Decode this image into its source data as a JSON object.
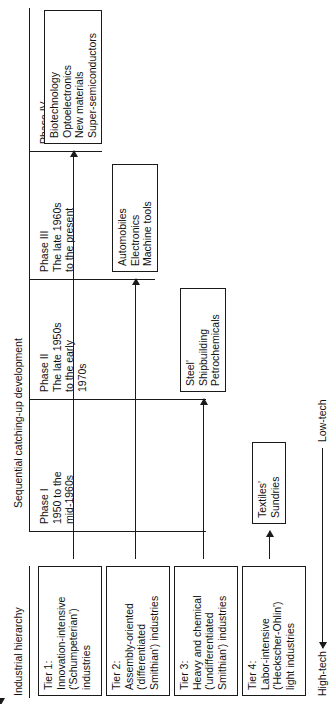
{
  "figure": {
    "left_header": "Industrial hierarchy",
    "right_header": "Sequential catching-up development",
    "axis_top_label": "High-tech",
    "axis_bottom_label": "Low-tech"
  },
  "phases": [
    {
      "name": "Phase I",
      "period": "1950 to the\nmid-1960s"
    },
    {
      "name": "Phase II",
      "period": "The late 1950s\nto the early\n1970s"
    },
    {
      "name": "Phase III",
      "period": "The late 1960s\nto the present"
    },
    {
      "name": "Phase IV",
      "period": "The early 1980s\nonward"
    }
  ],
  "tiers": [
    {
      "id": "tier-1",
      "label": "Tier 1:\nInnovation-intensive\n('Schumpeterian')\nindustries"
    },
    {
      "id": "tier-2",
      "label": "Tier 2:\nAssembly-oriented\n('differentiated\nSmithian') industries"
    },
    {
      "id": "tier-3",
      "label": "Tier 3:\nHeavy and chemical\n('undifferentiated\nSmithian') industries"
    },
    {
      "id": "tier-4",
      "label": "Tier 4:\nLabor-intensive\n('Heckscher-Ohlin')\nlight industries"
    }
  ],
  "industry_boxes": [
    {
      "id": "tier-1-industries",
      "tier": "Tier 1",
      "phase": "Phase IV",
      "items": "Biotechnology\nOptoelectronics\nNew materials\nSuper-semiconductors"
    },
    {
      "id": "tier-2-industries",
      "tier": "Tier 2",
      "phase": "Phase III",
      "items": "Automobiles\nElectronics\nMachine tools"
    },
    {
      "id": "tier-3-industries",
      "tier": "Tier 3",
      "phase": "Phase II",
      "items": "Steel'\nShipbuilding\nPetrochemicals"
    },
    {
      "id": "tier-4-industries",
      "tier": "Tier 4",
      "phase": "Phase I",
      "items": "Textiles'\nSundries"
    }
  ],
  "colors": {
    "ink": "#1a1a1a",
    "background": "#ffffff"
  }
}
